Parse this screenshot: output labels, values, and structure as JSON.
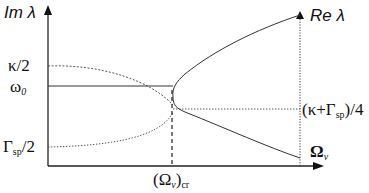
{
  "diagram": {
    "axes": {
      "left_axis_label": "Im λ",
      "right_axis_label": "Re λ",
      "x_axis_label_main": "Ω",
      "x_axis_label_sub": "ν"
    },
    "left_ticks": [
      {
        "main": "κ/2",
        "sub": ""
      },
      {
        "main": "ω",
        "sub": "0"
      },
      {
        "main": "Γ",
        "sub": "sp",
        "suffix": "/2"
      }
    ],
    "right_tick": {
      "prefix": "(κ+Γ",
      "sub": "sp",
      "suffix": ")/4"
    },
    "critical_point": {
      "prefix": "(Ω",
      "sub": "ν",
      "suffix": ")",
      "sub2": "cr"
    },
    "colors": {
      "line": "#222222",
      "background": "#ffffff"
    }
  }
}
